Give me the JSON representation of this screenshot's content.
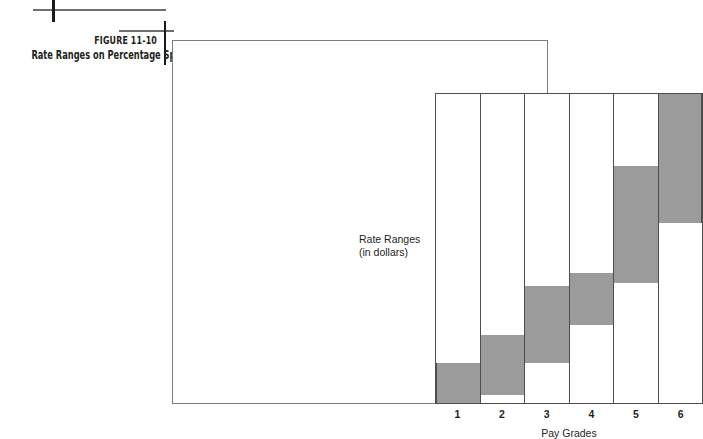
{
  "caption": {
    "figure_number": "FIGURE 11-10",
    "figure_title": "Rate Ranges on Percentage Spreads"
  },
  "colors": {
    "bar_fill": "#9b9b9b",
    "bar_stroke": "#4d4d4d",
    "frame_stroke": "#7d7d7d",
    "text": "#231f20",
    "background": "#ffffff"
  },
  "chart_data": {
    "type": "bar",
    "title": "Rate Ranges on Percentage Spreads",
    "xlabel": "Pay Grades",
    "ylabel": "Rate Ranges (in dollars)",
    "ylabel_line1": "Rate Ranges",
    "ylabel_line2": "(in dollars)",
    "categories": [
      "1",
      "2",
      "3",
      "4",
      "5",
      "6"
    ],
    "ylim": [
      0,
      100
    ],
    "grid": false,
    "legend": "none",
    "note": "Floating range bars: each pay grade has a minimum and maximum rate; ranges overlap and rise with grade. Values are percentages of the plot height (0 = bottom of column, 100 = top of column).",
    "series": [
      {
        "name": "Range minimum",
        "values": [
          0,
          2.6,
          12.9,
          25.1,
          38.9,
          58.2
        ]
      },
      {
        "name": "Range maximum",
        "values": [
          12.9,
          21.9,
          37.9,
          42.1,
          76.8,
          100.0
        ]
      }
    ],
    "ranges": [
      {
        "grade": "1",
        "min_pct": 0.0,
        "max_pct": 12.9
      },
      {
        "grade": "2",
        "min_pct": 2.6,
        "max_pct": 21.9
      },
      {
        "grade": "3",
        "min_pct": 12.9,
        "max_pct": 37.9
      },
      {
        "grade": "4",
        "min_pct": 25.1,
        "max_pct": 42.1
      },
      {
        "grade": "5",
        "min_pct": 38.9,
        "max_pct": 76.8
      },
      {
        "grade": "6",
        "min_pct": 58.2,
        "max_pct": 100.0
      }
    ]
  }
}
